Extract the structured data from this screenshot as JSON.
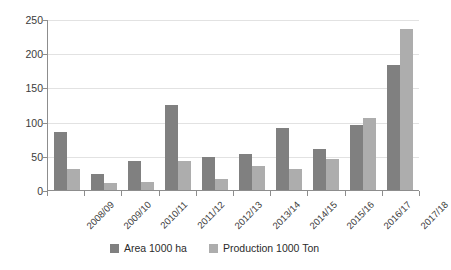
{
  "chart_data": {
    "type": "bar",
    "title": "",
    "subtitle": "",
    "xlabel": "",
    "ylabel": "",
    "ylim": [
      0,
      250
    ],
    "ytick_step": 50,
    "yticks": [
      0,
      50,
      100,
      150,
      200,
      250
    ],
    "ytick_labels": [
      "0",
      "50",
      "100",
      "150",
      "200",
      "250"
    ],
    "grid": true,
    "grid_axis": "y",
    "legend_position": "bottom",
    "categories": [
      "2008/09",
      "2009/10",
      "2010/11",
      "2011/12",
      "2012/13",
      "2013/14",
      "2014/15",
      "2015/16",
      "2016/17",
      "2017/18"
    ],
    "series": [
      {
        "name": "Area 1000 ha",
        "color": "#808080",
        "values": [
          85,
          24,
          42,
          124,
          48,
          52,
          90,
          60,
          95,
          183
        ]
      },
      {
        "name": "Production 1000 Ton",
        "color": "#adadad",
        "values": [
          30,
          10,
          12,
          42,
          16,
          35,
          31,
          46,
          105,
          236
        ]
      }
    ]
  },
  "legend": {
    "items": [
      {
        "label": "Area 1000 ha",
        "swatch": "series-area"
      },
      {
        "label": "Production 1000 Ton",
        "swatch": "series-production"
      }
    ]
  }
}
